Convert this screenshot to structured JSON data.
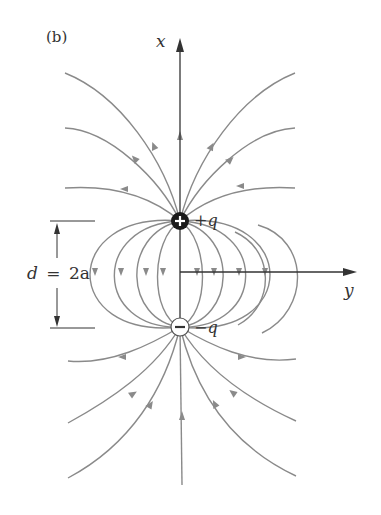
{
  "figure": {
    "panel_label": "(b)",
    "axes": {
      "vertical_label": "x",
      "horizontal_label": "y"
    },
    "charges": [
      {
        "label": "+q",
        "sign": "+",
        "symbol": "plus-icon"
      },
      {
        "label": "−q",
        "sign": "−",
        "symbol": "minus-icon"
      }
    ],
    "dimension": {
      "label": "d = 2a",
      "lhs": "d",
      "eq": "=",
      "rhs": "2a"
    },
    "colors": {
      "field_line": "#8a8a8a",
      "axis": "#333333",
      "positive_charge": "#1a1a1a",
      "negative_charge": "#ffffff"
    }
  }
}
